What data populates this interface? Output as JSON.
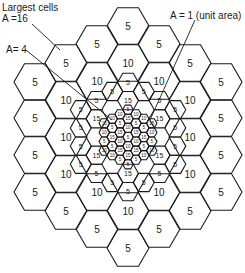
{
  "annotations": {
    "largest_title": "Largest cells",
    "largest_area": "A =16",
    "medium_area": "A= 4",
    "unit_area": "A = 1 (unit area)"
  },
  "large_cells": [
    {
      "x": 35,
      "y": 82,
      "label": "5"
    },
    {
      "x": 35,
      "y": 118,
      "label": "5"
    },
    {
      "x": 35,
      "y": 155,
      "label": "5"
    },
    {
      "x": 35,
      "y": 192,
      "label": "5"
    },
    {
      "x": 66,
      "y": 63,
      "label": "5"
    },
    {
      "x": 66,
      "y": 100,
      "label": "10"
    },
    {
      "x": 66,
      "y": 137,
      "label": "10"
    },
    {
      "x": 66,
      "y": 174,
      "label": "10"
    },
    {
      "x": 66,
      "y": 211,
      "label": "5"
    },
    {
      "x": 97,
      "y": 44,
      "label": "5"
    },
    {
      "x": 97,
      "y": 81,
      "label": "10"
    },
    {
      "x": 97,
      "y": 192,
      "label": "10"
    },
    {
      "x": 97,
      "y": 229,
      "label": "5"
    },
    {
      "x": 128,
      "y": 26,
      "label": "5"
    },
    {
      "x": 128,
      "y": 63,
      "label": "10"
    },
    {
      "x": 128,
      "y": 211,
      "label": "10"
    },
    {
      "x": 128,
      "y": 248,
      "label": "5"
    },
    {
      "x": 159,
      "y": 44,
      "label": "5"
    },
    {
      "x": 159,
      "y": 81,
      "label": "10"
    },
    {
      "x": 159,
      "y": 192,
      "label": "10"
    },
    {
      "x": 159,
      "y": 229,
      "label": "5"
    },
    {
      "x": 190,
      "y": 63,
      "label": "5"
    },
    {
      "x": 190,
      "y": 100,
      "label": "10"
    },
    {
      "x": 190,
      "y": 137,
      "label": "10"
    },
    {
      "x": 190,
      "y": 174,
      "label": "10"
    },
    {
      "x": 190,
      "y": 211,
      "label": "5"
    },
    {
      "x": 221,
      "y": 82,
      "label": "5"
    },
    {
      "x": 221,
      "y": 118,
      "label": "5"
    },
    {
      "x": 221,
      "y": 155,
      "label": "5"
    },
    {
      "x": 221,
      "y": 192,
      "label": "5"
    }
  ],
  "medium_ring_outer_label": "5",
  "medium_ring_inner_label": "15",
  "small_labels": [
    "5",
    "10",
    "15"
  ]
}
